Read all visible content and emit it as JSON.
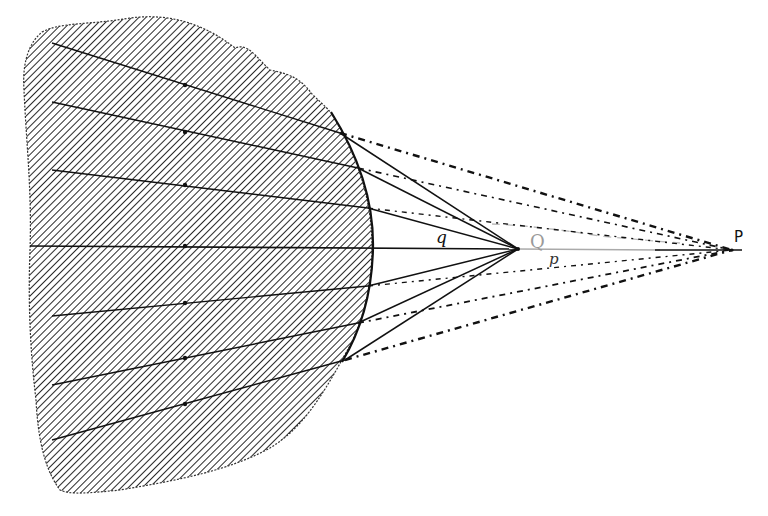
{
  "figure": {
    "labels": {
      "q": "q",
      "Q": "Q",
      "p": "p",
      "P": "P"
    },
    "colors": {
      "ink": "#111111",
      "hatch": "#2a2a2a",
      "faint_label": "#9a9a9a",
      "background": "#ffffff"
    },
    "axis_y": 247,
    "points": {
      "Q": [
        518,
        250
      ],
      "P": [
        732,
        250
      ]
    },
    "surface_hits": [
      [
        340,
        133
      ],
      [
        358,
        168
      ],
      [
        368,
        208
      ],
      [
        372,
        247
      ],
      [
        368,
        286
      ],
      [
        358,
        323
      ],
      [
        345,
        360
      ]
    ],
    "ray_starts": [
      [
        52,
        43
      ],
      [
        52,
        102
      ],
      [
        52,
        170
      ],
      [
        30,
        245
      ],
      [
        52,
        316
      ],
      [
        52,
        385
      ],
      [
        52,
        440
      ]
    ]
  }
}
